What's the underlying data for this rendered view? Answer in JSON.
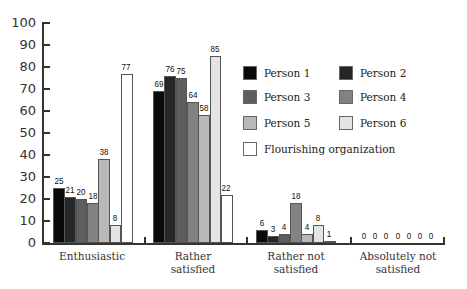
{
  "chart_data": {
    "type": "bar",
    "title": "",
    "xlabel": "",
    "ylabel": "",
    "ylim": [
      0,
      100
    ],
    "yticks": [
      0,
      10,
      20,
      30,
      40,
      50,
      60,
      70,
      80,
      90,
      100
    ],
    "grid": false,
    "legend_position": "right-inside",
    "categories": [
      "Enthusiastic",
      "Rather satisfied",
      "Rather not satisfied",
      "Absolutely not satisfied"
    ],
    "category_lines": [
      [
        "Enthusiastic"
      ],
      [
        "Rather",
        "satisfied"
      ],
      [
        "Rather not",
        "satisfied"
      ],
      [
        "Absolutely not",
        "satisfied"
      ]
    ],
    "series": [
      {
        "name": "Person 1",
        "color": "#0a0a0a",
        "values": [
          25,
          69,
          6,
          0
        ]
      },
      {
        "name": "Person 2",
        "color": "#262626",
        "values": [
          21,
          76,
          3,
          0
        ]
      },
      {
        "name": "Person 3",
        "color": "#5e5e5e",
        "values": [
          20,
          75,
          4,
          0
        ]
      },
      {
        "name": "Person 4",
        "color": "#828282",
        "values": [
          18,
          64,
          18,
          0
        ]
      },
      {
        "name": "Person 5",
        "color": "#b8b8b8",
        "values": [
          38,
          58,
          4,
          0
        ]
      },
      {
        "name": "Person 6",
        "color": "#e4e4e4",
        "values": [
          8,
          85,
          8,
          0
        ]
      },
      {
        "name": "Flourishing organization",
        "color": "#ffffff",
        "values": [
          77,
          22,
          1,
          0
        ]
      }
    ]
  }
}
